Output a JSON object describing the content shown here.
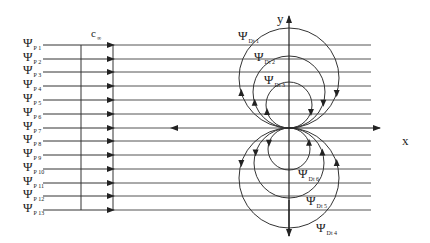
{
  "figure": {
    "velocity_label": {
      "main": "c",
      "sub": "∞"
    },
    "axes": {
      "x_label": "x",
      "y_label": "y",
      "origin": [
        289,
        128
      ]
    },
    "parallel_flow": {
      "symbol": "Ψ",
      "x_start": 43,
      "x_end": 371,
      "lines": [
        {
          "sub": "P 1",
          "y": 45
        },
        {
          "sub": "P 2",
          "y": 59
        },
        {
          "sub": "P 3",
          "y": 72
        },
        {
          "sub": "P 4",
          "y": 86
        },
        {
          "sub": "P 5",
          "y": 100
        },
        {
          "sub": "P 6",
          "y": 114
        },
        {
          "sub": "P 7",
          "y": 128
        },
        {
          "sub": "P 8",
          "y": 141
        },
        {
          "sub": "P 9",
          "y": 155
        },
        {
          "sub": "P 10",
          "y": 169
        },
        {
          "sub": "P 11",
          "y": 183
        },
        {
          "sub": "P 12",
          "y": 196
        },
        {
          "sub": "P 13",
          "y": 210
        }
      ]
    },
    "doublet_streamlines": [
      {
        "sub": "Dt 1",
        "cy": 78,
        "r": 50,
        "label_x": 238,
        "label_y": 29
      },
      {
        "sub": "Dt 2",
        "cy": 92,
        "r": 36,
        "label_x": 254,
        "label_y": 50
      },
      {
        "sub": "Dt 3",
        "cy": 105,
        "r": 23,
        "label_x": 264,
        "label_y": 73
      },
      {
        "sub": "Dt 4",
        "cy": 178,
        "r": 50,
        "label_x": 316,
        "label_y": 221
      },
      {
        "sub": "Dt 5",
        "cy": 163,
        "r": 35,
        "label_x": 306,
        "label_y": 194
      },
      {
        "sub": "Dt 6",
        "cy": 149,
        "r": 21,
        "label_x": 298,
        "label_y": 167
      }
    ]
  }
}
